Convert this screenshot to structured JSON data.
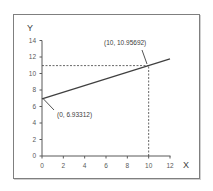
{
  "chart_data": {
    "type": "line",
    "title": "",
    "xlabel": "X",
    "ylabel": "Y",
    "xlim": [
      0,
      12
    ],
    "ylim": [
      0,
      14
    ],
    "x_ticks": [
      "0",
      "2",
      "4",
      "6",
      "8",
      "10",
      "12"
    ],
    "y_ticks": [
      "0",
      "2",
      "4",
      "6",
      "8",
      "10",
      "12",
      "14"
    ],
    "grid": false,
    "legend": null,
    "series": [
      {
        "name": "line",
        "x": [
          0,
          12
        ],
        "y": [
          6.93312,
          11.76143
        ],
        "color": "#404040"
      }
    ],
    "annotations": [
      {
        "label": "(0, 6.93312)",
        "x": 0,
        "y": 6.93312
      },
      {
        "label": "(10, 10.95692)",
        "x": 10,
        "y": 10.95692
      }
    ],
    "guides": [
      {
        "type": "dashed-horizontal",
        "y": 10.95692,
        "x_from": 0,
        "x_to": 10
      },
      {
        "type": "dashed-vertical",
        "x": 10,
        "y_from": 0,
        "y_to": 10.95692
      }
    ]
  }
}
